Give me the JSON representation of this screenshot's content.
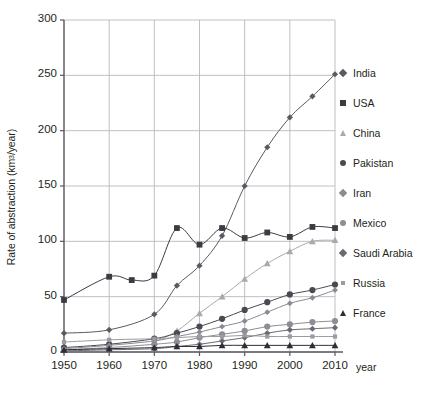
{
  "chart_data": {
    "type": "line",
    "title": "",
    "xlabel": "year",
    "ylabel": "Rate of abstraction (km3/year)",
    "ylabel_prefix": "Rate of abstraction (km",
    "ylabel_sup": "3",
    "ylabel_suffix": "/year)",
    "xlim": [
      1950,
      2010
    ],
    "ylim": [
      0,
      300
    ],
    "xticks": [
      1950,
      1960,
      1970,
      1980,
      1990,
      2000,
      2010
    ],
    "yticks": [
      0,
      50,
      100,
      150,
      200,
      250,
      300
    ],
    "grid": true,
    "legend_position": "right",
    "x_unit_label": "year",
    "series": [
      {
        "name": "India",
        "marker": "diamond",
        "color": "#5a5a62",
        "x": [
          1950,
          1960,
          1970,
          1975,
          1980,
          1985,
          1990,
          1995,
          2000,
          2005,
          2010
        ],
        "values": [
          17,
          20,
          34,
          60,
          78,
          105,
          150,
          185,
          212,
          231,
          251
        ]
      },
      {
        "name": "USA",
        "marker": "square",
        "color": "#3b3b42",
        "x": [
          1950,
          1960,
          1965,
          1970,
          1975,
          1980,
          1985,
          1990,
          1995,
          2000,
          2005,
          2010
        ],
        "values": [
          47,
          68,
          65,
          69,
          112,
          97,
          112,
          103,
          108,
          104,
          113,
          112
        ]
      },
      {
        "name": "China",
        "marker": "triangle",
        "color": "#a9a9b0",
        "x": [
          1970,
          1975,
          1980,
          1985,
          1990,
          1995,
          2000,
          2005,
          2010
        ],
        "values": [
          9,
          19,
          35,
          50,
          66,
          80,
          91,
          100,
          101
        ]
      },
      {
        "name": "Pakistan",
        "marker": "circle-dark",
        "color": "#4a4a52",
        "x": [
          1950,
          1960,
          1970,
          1975,
          1980,
          1985,
          1990,
          1995,
          2000,
          2005,
          2010
        ],
        "values": [
          4,
          7,
          12,
          17,
          23,
          30,
          38,
          45,
          52,
          56,
          61
        ]
      },
      {
        "name": "Iran",
        "marker": "diamond-light",
        "color": "#8a8a92",
        "x": [
          1950,
          1960,
          1970,
          1975,
          1980,
          1985,
          1990,
          1995,
          2000,
          2005,
          2010
        ],
        "values": [
          3,
          6,
          10,
          14,
          18,
          23,
          28,
          36,
          44,
          49,
          56
        ]
      },
      {
        "name": "Mexico",
        "marker": "circle-gray",
        "color": "#8d8d95",
        "x": [
          1950,
          1960,
          1970,
          1975,
          1980,
          1985,
          1990,
          1995,
          2000,
          2005,
          2010
        ],
        "values": [
          2,
          4,
          7,
          9,
          13,
          16,
          19,
          23,
          25,
          27,
          28
        ]
      },
      {
        "name": "Saudi Arabia",
        "marker": "diamond",
        "color": "#6a6a72",
        "x": [
          1950,
          1960,
          1970,
          1975,
          1980,
          1985,
          1990,
          1995,
          2000,
          2005,
          2010
        ],
        "values": [
          1,
          2,
          3,
          5,
          7,
          10,
          13,
          17,
          20,
          21,
          22
        ]
      },
      {
        "name": "Russia",
        "marker": "square-small",
        "color": "#9a9aa2",
        "x": [
          1950,
          1960,
          1970,
          1975,
          1980,
          1985,
          1990,
          1995,
          2000,
          2005,
          2010
        ],
        "values": [
          9,
          11,
          12,
          13,
          14,
          14,
          15,
          14,
          14,
          14,
          14
        ]
      },
      {
        "name": "France",
        "marker": "triangle-dark",
        "color": "#2e2e35",
        "x": [
          1950,
          1960,
          1970,
          1975,
          1980,
          1985,
          1990,
          1995,
          2000,
          2005,
          2010
        ],
        "values": [
          2,
          3,
          4,
          5,
          5,
          6,
          6,
          6,
          6,
          6,
          6
        ]
      }
    ]
  },
  "colors": {
    "grid": "#b9b9bd",
    "axis": "#58585f",
    "text": "#231f20"
  }
}
